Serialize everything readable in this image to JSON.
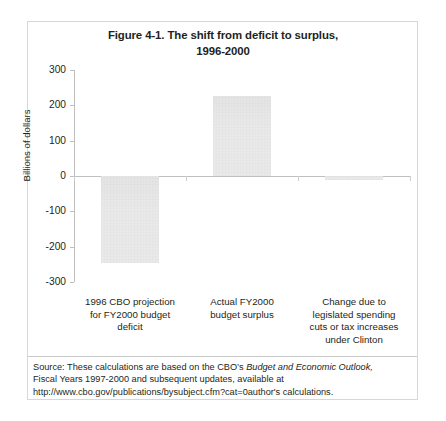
{
  "figure": {
    "title_line1": "Figure 4-1. The shift from deficit to surplus,",
    "title_line2": "1996-2000"
  },
  "source": {
    "line1_prefix": "Source: These calculations are based on the CBO’s ",
    "line1_italic": "Budget and Economic Outlook,",
    "line2": "Fiscal Years 1997-2000 and subsequent updates, available at",
    "line3": "http://www.cbo.gov/publications/bysubject.cfm?cat=0author's calculations."
  },
  "chart_data": {
    "type": "bar",
    "title": "Figure 4-1. The shift from deficit to surplus, 1996-2000",
    "xlabel": "",
    "ylabel": "Billions of dollars",
    "ylim": [
      -300,
      300
    ],
    "yticks": [
      300,
      200,
      100,
      0,
      -100,
      -200,
      -300
    ],
    "ytick_labels": [
      "300",
      "200",
      "100",
      "0",
      "-100",
      "-200",
      "-300"
    ],
    "grid": false,
    "legend": "none",
    "bar_color": "#e9e9e9",
    "categories": [
      "1996 CBO projection for FY2000 budget deficit",
      "Actual FY2000 budget surplus",
      "Change due to legislated spending cuts or tax increases under Clinton"
    ],
    "category_label_lines": [
      [
        "1996 CBO projection",
        "for FY2000 budget",
        "deficit"
      ],
      [
        "Actual FY2000",
        "budget surplus"
      ],
      [
        "Change due to",
        "legislated spending",
        "cuts or tax increases",
        "under Clinton"
      ]
    ],
    "values": [
      -246,
      227,
      -12
    ]
  }
}
